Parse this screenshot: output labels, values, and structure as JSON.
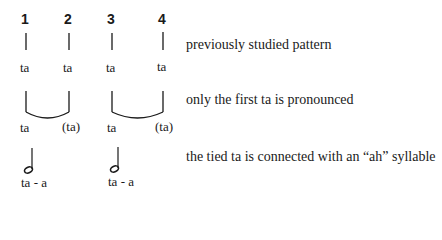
{
  "rows": [
    {
      "name": "quarter-notes-row",
      "beats": [
        "1",
        "2",
        "3",
        "4"
      ],
      "syllables": [
        "ta",
        "ta",
        "ta",
        "ta"
      ],
      "description": "previously studied pattern"
    },
    {
      "name": "tied-notes-row",
      "syllables": [
        "ta",
        "(ta)",
        "ta",
        "(ta)"
      ],
      "description": "only the first ta is pronounced"
    },
    {
      "name": "half-notes-row",
      "syllables": [
        "ta - a",
        "ta - a"
      ],
      "description": "the tied ta is connected with an “ah” syllable"
    }
  ],
  "icons": {
    "stem": "vertical-stem",
    "tie": "curved-tie",
    "half_note": "half-note"
  },
  "colors": {
    "ink": "#1a1a1a",
    "background": "#ffffff"
  }
}
